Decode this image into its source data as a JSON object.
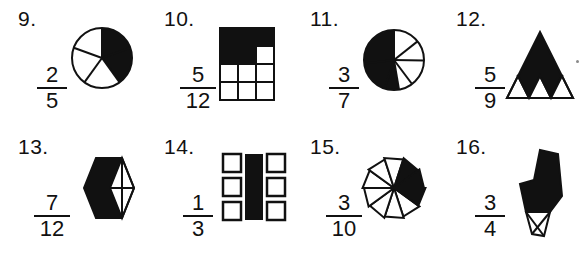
{
  "worksheet": {
    "title": "Fraction shading worksheet items 9-16",
    "ink_color": "#111111",
    "shade_color": "#111111",
    "paper_color": "#ffffff"
  },
  "problems": [
    {
      "number": "9.",
      "numerator": "2",
      "denominator": "5",
      "figure": "circle-5-sectors",
      "shaded_parts": 2,
      "total_parts": 5
    },
    {
      "number": "10.",
      "numerator": "5",
      "denominator": "12",
      "figure": "grid-3x4",
      "shaded_parts": 5,
      "total_parts": 12
    },
    {
      "number": "11.",
      "numerator": "3",
      "denominator": "7",
      "figure": "circle-7-sectors",
      "shaded_parts": 3,
      "total_parts": 7
    },
    {
      "number": "12.",
      "numerator": "5",
      "denominator": "9",
      "figure": "triangle-9-parts",
      "shaded_parts": 5,
      "total_parts": 9
    },
    {
      "number": "13.",
      "numerator": "7",
      "denominator": "12",
      "figure": "hexagon-12-parts",
      "shaded_parts": 7,
      "total_parts": 12
    },
    {
      "number": "14.",
      "numerator": "1",
      "denominator": "3",
      "figure": "squares-cross-9",
      "shaded_parts": 3,
      "total_parts": 9
    },
    {
      "number": "15.",
      "numerator": "3",
      "denominator": "10",
      "figure": "pinwheel-10-blades",
      "shaded_parts": 3,
      "total_parts": 10
    },
    {
      "number": "16.",
      "numerator": "3",
      "denominator": "4",
      "figure": "polygon-4-parts",
      "shaded_parts": 3,
      "total_parts": 4
    }
  ]
}
